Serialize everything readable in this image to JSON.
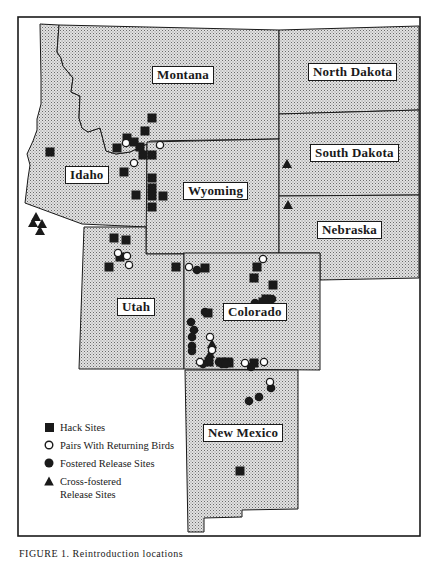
{
  "map": {
    "frame": {
      "left": 18,
      "top": 17,
      "right": 420,
      "bottom": 536
    },
    "fill_color": "#c8c8c8",
    "line_color": "#1a1a1a",
    "states": [
      {
        "name": "Montana",
        "label_x": 152,
        "label_y": 66
      },
      {
        "name": "Idaho",
        "label_x": 65,
        "label_y": 166
      },
      {
        "name": "Wyoming",
        "label_x": 183,
        "label_y": 182
      },
      {
        "name": "North Dakota",
        "label_x": 308,
        "label_y": 63
      },
      {
        "name": "South Dakota",
        "label_x": 310,
        "label_y": 144
      },
      {
        "name": "Nebraska",
        "label_x": 317,
        "label_y": 221
      },
      {
        "name": "Utah",
        "label_x": 117,
        "label_y": 299
      },
      {
        "name": "Colorado",
        "label_x": 223,
        "label_y": 303
      },
      {
        "name": "New Mexico",
        "label_x": 203,
        "label_y": 424
      }
    ]
  },
  "legend": {
    "items": [
      {
        "symbol": "square",
        "label": "Hack Sites"
      },
      {
        "symbol": "open-circle",
        "label": "Pairs With Returning Birds"
      },
      {
        "symbol": "filled-circle",
        "label": "Fostered Release Sites"
      },
      {
        "symbol": "triangle",
        "label": "Cross-fostered",
        "label2": "Release Sites"
      }
    ]
  },
  "sites": {
    "hack": [
      [
        50,
        152
      ],
      [
        152,
        118
      ],
      [
        145,
        131
      ],
      [
        127,
        138
      ],
      [
        117,
        148
      ],
      [
        134,
        142
      ],
      [
        140,
        147
      ],
      [
        143,
        155
      ],
      [
        152,
        155
      ],
      [
        124,
        172
      ],
      [
        152,
        178
      ],
      [
        152,
        188
      ],
      [
        136,
        195
      ],
      [
        163,
        196
      ],
      [
        152,
        196
      ],
      [
        152,
        207
      ],
      [
        114,
        238
      ],
      [
        126,
        240
      ],
      [
        120,
        257
      ],
      [
        109,
        267
      ],
      [
        176,
        267
      ],
      [
        205,
        268
      ],
      [
        257,
        267
      ],
      [
        254,
        278
      ],
      [
        273,
        285
      ],
      [
        266,
        299
      ],
      [
        263,
        302
      ],
      [
        208,
        313
      ],
      [
        209,
        362
      ],
      [
        221,
        362
      ],
      [
        229,
        363
      ],
      [
        228,
        362
      ],
      [
        254,
        363
      ],
      [
        240,
        471
      ]
    ],
    "open_circle": [
      [
        126,
        143
      ],
      [
        160,
        145
      ],
      [
        134,
        163
      ],
      [
        118,
        253
      ],
      [
        127,
        256
      ],
      [
        129,
        265
      ],
      [
        189,
        267
      ],
      [
        263,
        259
      ],
      [
        210,
        337
      ],
      [
        212,
        350
      ],
      [
        200,
        362
      ],
      [
        245,
        363
      ],
      [
        264,
        362
      ],
      [
        270,
        382
      ]
    ],
    "filled_circle": [
      [
        197,
        270
      ],
      [
        272,
        299
      ],
      [
        205,
        312
      ],
      [
        191,
        322
      ],
      [
        194,
        330
      ],
      [
        192,
        337
      ],
      [
        192,
        346
      ],
      [
        192,
        351
      ],
      [
        255,
        303
      ],
      [
        203,
        364
      ],
      [
        219,
        362
      ],
      [
        222,
        364
      ],
      [
        226,
        364
      ],
      [
        249,
        401
      ],
      [
        259,
        397
      ],
      [
        271,
        388
      ],
      [
        251,
        367
      ]
    ],
    "triangle": [
      [
        36,
        217
      ],
      [
        33,
        223
      ],
      [
        42,
        224
      ],
      [
        40,
        231
      ],
      [
        287,
        164
      ],
      [
        288,
        205
      ],
      [
        212,
        344
      ],
      [
        210,
        354
      ]
    ]
  },
  "caption": {
    "text": "FIGURE 1.  Reintroduction locations"
  }
}
